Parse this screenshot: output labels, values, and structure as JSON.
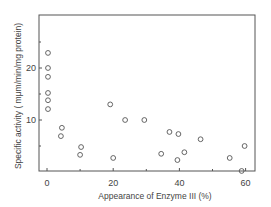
{
  "chart_data": {
    "type": "scatter",
    "title": "",
    "xlabel": "Appearance of Enzyme III (%)",
    "ylabel": "Specific activity (mμm/min/mg protein)",
    "xlim": [
      -2.5,
      63
    ],
    "ylim": [
      0,
      30
    ],
    "x_ticks": [
      0,
      20,
      40,
      60
    ],
    "x_minor_ticks": [
      10,
      30,
      50
    ],
    "y_ticks": [
      10,
      20
    ],
    "y_minor_ticks": [
      5,
      15,
      25
    ],
    "grid": false,
    "legend": null,
    "marker": "open-circle",
    "series": [
      {
        "name": "samples",
        "points": [
          {
            "x": 0.3,
            "y": 22.9
          },
          {
            "x": 0.3,
            "y": 20.0
          },
          {
            "x": 0.3,
            "y": 18.3
          },
          {
            "x": 0.3,
            "y": 15.2
          },
          {
            "x": 0.3,
            "y": 13.8
          },
          {
            "x": 0.3,
            "y": 12.1
          },
          {
            "x": 4.5,
            "y": 8.5
          },
          {
            "x": 4.2,
            "y": 6.9
          },
          {
            "x": 10.3,
            "y": 4.8
          },
          {
            "x": 10.0,
            "y": 3.3
          },
          {
            "x": 19.1,
            "y": 13.0
          },
          {
            "x": 20.0,
            "y": 2.7
          },
          {
            "x": 23.6,
            "y": 10.0
          },
          {
            "x": 29.4,
            "y": 10.0
          },
          {
            "x": 34.5,
            "y": 3.5
          },
          {
            "x": 37.0,
            "y": 7.7
          },
          {
            "x": 39.7,
            "y": 7.3
          },
          {
            "x": 39.4,
            "y": 2.3
          },
          {
            "x": 41.5,
            "y": 3.8
          },
          {
            "x": 46.4,
            "y": 6.3
          },
          {
            "x": 55.2,
            "y": 2.7
          },
          {
            "x": 59.7,
            "y": 5.0
          },
          {
            "x": 58.8,
            "y": 0.2
          }
        ]
      }
    ]
  },
  "axes": {
    "x_title": "Appearance of Enzyme III (%)",
    "y_title": "Specific activity ( mμm/min/mg protein)",
    "x_tick_labels": [
      "0",
      "20",
      "40",
      "60"
    ],
    "y_tick_labels": [
      "10",
      "20"
    ]
  },
  "colors": {
    "axis": "#555555",
    "marker": "#555555",
    "text": "#444444"
  }
}
